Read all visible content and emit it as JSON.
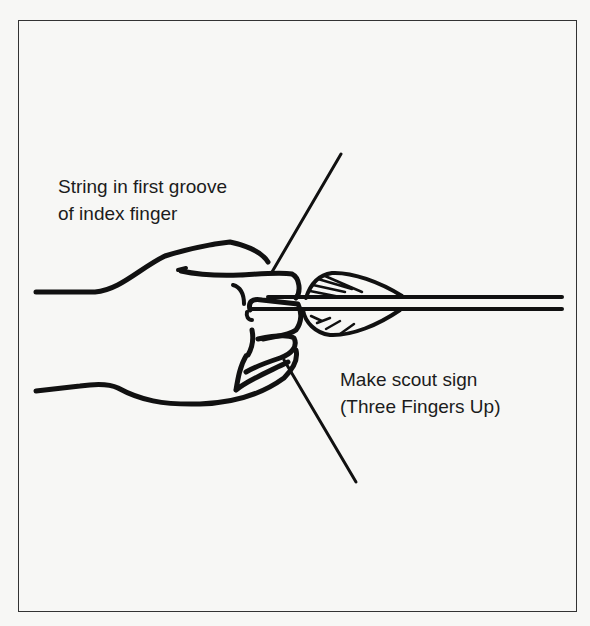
{
  "figure": {
    "annotations": {
      "string_position": {
        "line1": "String in first groove",
        "line2": "of index finger"
      },
      "finger_position": {
        "line1": "Make scout sign",
        "line2": "(Three Fingers Up)"
      }
    },
    "colors": {
      "ink": "#111111",
      "paper": "#f7f7f5",
      "frame": "#333333"
    }
  }
}
